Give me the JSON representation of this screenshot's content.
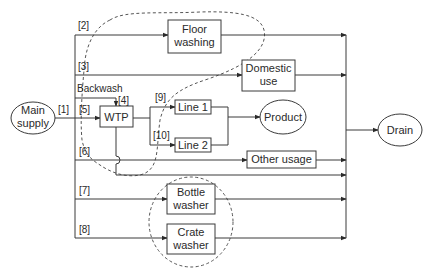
{
  "diagram": {
    "nodes": {
      "main_supply": {
        "line1": "Main",
        "line2": "supply"
      },
      "wtp": {
        "label": "WTP"
      },
      "floor_washing": {
        "line1": "Floor",
        "line2": "washing"
      },
      "domestic_use": {
        "line1": "Domestic",
        "line2": "use"
      },
      "line1": {
        "label": "Line 1"
      },
      "line2": {
        "label": "Line 2"
      },
      "product": {
        "label": "Product"
      },
      "other_usage": {
        "label": "Other usage"
      },
      "bottle_washer": {
        "line1": "Bottle",
        "line2": "washer"
      },
      "crate_washer": {
        "line1": "Crate",
        "line2": "washer"
      },
      "drain": {
        "label": "Drain"
      }
    },
    "flow_labels": {
      "f1": "[1]",
      "f2": "[2]",
      "f3": "[3]",
      "f4": "[4]",
      "f5": "[5]",
      "f6": "[6]",
      "f7": "[7]",
      "f8": "[8]",
      "f9": "[9]",
      "f10": "[10]",
      "backwash": "Backwash"
    },
    "colors": {
      "line": "#3a3a3a",
      "dashed_boundary": "#555555",
      "background": "#ffffff"
    }
  }
}
